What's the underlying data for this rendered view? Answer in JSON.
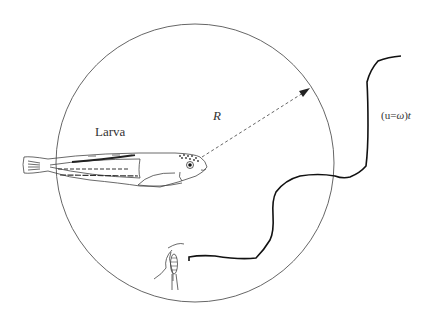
{
  "labels": {
    "larva": "Larva",
    "radius": "R",
    "path_prefix": "(u=",
    "path_omega": "ω",
    "path_suffix": ")",
    "path_t": "t"
  },
  "diagram": {
    "type": "perception-field schematic",
    "circle": {
      "cx": 195,
      "cy": 163,
      "r": 139,
      "stroke": "#555555"
    },
    "elements": [
      {
        "id": "larva",
        "kind": "fish-larva-drawing",
        "description": "Fish larva at left of the circle, head near center"
      },
      {
        "id": "radius-arrow",
        "kind": "dashed-arrow",
        "from": [
          202,
          157
        ],
        "to": [
          310,
          90
        ],
        "label": "R"
      },
      {
        "id": "prey",
        "kind": "copepod-drawing",
        "position": [
          175,
          270
        ]
      },
      {
        "id": "prey-path",
        "kind": "wavy-path",
        "label": "(u=ω)t"
      }
    ],
    "colors": {
      "line": "#222222",
      "circle": "#555555",
      "text": "#333333"
    }
  }
}
